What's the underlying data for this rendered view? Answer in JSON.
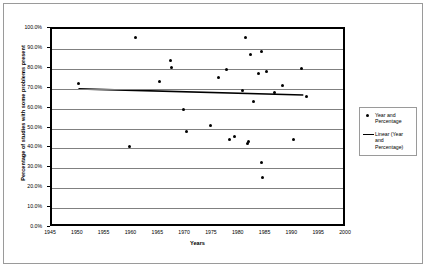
{
  "chart_data": {
    "type": "scatter",
    "title": "",
    "xlabel": "Years",
    "ylabel": "Percentage of studies with some problems present",
    "xlim": [
      1945,
      2000
    ],
    "ylim": [
      0,
      1
    ],
    "grid": true,
    "legend_position": "right",
    "x_ticks": [
      "1945",
      "1950",
      "1955",
      "1960",
      "1965",
      "1970",
      "1975",
      "1980",
      "1985",
      "1990",
      "1995",
      "2000"
    ],
    "x_tick_values": [
      1945,
      1950,
      1955,
      1960,
      1965,
      1970,
      1975,
      1980,
      1985,
      1990,
      1995,
      2000
    ],
    "y_ticks": [
      "0.0%",
      "10.0%",
      "20.0%",
      "30.0%",
      "40.0%",
      "50.0%",
      "60.0%",
      "70.0%",
      "80.0%",
      "90.0%",
      "100.0%"
    ],
    "y_tick_values": [
      0,
      10,
      20,
      30,
      40,
      50,
      60,
      70,
      80,
      90,
      100
    ],
    "series": [
      {
        "name": "Year and Percentage",
        "type": "scatter",
        "marker": "filled-circle",
        "color": "#000000",
        "points": [
          {
            "x": 1950.0,
            "y": 72.5
          },
          {
            "x": 1959.5,
            "y": 41.0
          },
          {
            "x": 1960.5,
            "y": 95.5
          },
          {
            "x": 1965.0,
            "y": 73.5
          },
          {
            "x": 1967.0,
            "y": 84.0
          },
          {
            "x": 1967.2,
            "y": 80.5
          },
          {
            "x": 1969.5,
            "y": 59.5
          },
          {
            "x": 1970.0,
            "y": 48.5
          },
          {
            "x": 1974.5,
            "y": 51.5
          },
          {
            "x": 1976.0,
            "y": 75.5
          },
          {
            "x": 1977.5,
            "y": 79.5
          },
          {
            "x": 1978.0,
            "y": 44.5
          },
          {
            "x": 1979.0,
            "y": 46.0
          },
          {
            "x": 1980.5,
            "y": 69.0
          },
          {
            "x": 1981.0,
            "y": 95.5
          },
          {
            "x": 1981.5,
            "y": 42.5
          },
          {
            "x": 1981.6,
            "y": 43.5
          },
          {
            "x": 1982.0,
            "y": 87.0
          },
          {
            "x": 1982.5,
            "y": 63.5
          },
          {
            "x": 1983.5,
            "y": 77.5
          },
          {
            "x": 1984.0,
            "y": 88.5
          },
          {
            "x": 1984.0,
            "y": 33.0
          },
          {
            "x": 1984.2,
            "y": 25.5
          },
          {
            "x": 1985.0,
            "y": 78.5
          },
          {
            "x": 1986.5,
            "y": 68.0
          },
          {
            "x": 1988.0,
            "y": 71.5
          },
          {
            "x": 1990.0,
            "y": 44.5
          },
          {
            "x": 1991.5,
            "y": 80.0
          },
          {
            "x": 1992.5,
            "y": 66.0
          }
        ]
      },
      {
        "name": "Linear (Year and Percentage)",
        "type": "line",
        "color": "#000000",
        "trendline": true,
        "endpoints": [
          {
            "x": 1950.0,
            "y": 69.3
          },
          {
            "x": 1992.5,
            "y": 66.2
          }
        ]
      }
    ],
    "legend": [
      {
        "label": "Year and Percentage",
        "key": "marker"
      },
      {
        "label": "Linear (Year and Percentage)",
        "key": "line"
      }
    ]
  }
}
